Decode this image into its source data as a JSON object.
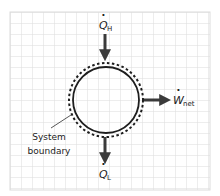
{
  "diagram": {
    "type": "thermodynamic-heat-engine-system",
    "colors": {
      "background": "#ffffff",
      "grid": "#dcdcdc",
      "stroke": "#1e1e1e",
      "arrow": "#3a3a3a",
      "text": "#222222"
    },
    "heat_in": {
      "symbol": "Q",
      "subscript": "H",
      "dot": "·"
    },
    "work_out": {
      "symbol": "W",
      "subscript": "net",
      "dot": "·"
    },
    "heat_out": {
      "symbol": "Q",
      "subscript": "L",
      "dot": "·"
    },
    "boundary_label": {
      "line1": "System",
      "line2": "boundary"
    }
  }
}
